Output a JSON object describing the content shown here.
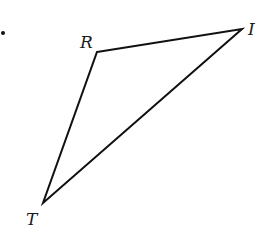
{
  "diagram": {
    "type": "triangle",
    "stroke_color": "#111111",
    "bullet": {
      "x": 3,
      "y": 33,
      "r": 2
    },
    "vertices": [
      {
        "id": "R",
        "label": "R",
        "x": 97,
        "y": 52,
        "label_x": 80,
        "label_y": 48
      },
      {
        "id": "I",
        "label": "I",
        "x": 242,
        "y": 29,
        "label_x": 248,
        "label_y": 35
      },
      {
        "id": "T",
        "label": "T",
        "x": 43,
        "y": 203,
        "label_x": 26,
        "label_y": 225
      }
    ],
    "edges": [
      [
        "R",
        "I"
      ],
      [
        "I",
        "T"
      ],
      [
        "T",
        "R"
      ]
    ]
  }
}
